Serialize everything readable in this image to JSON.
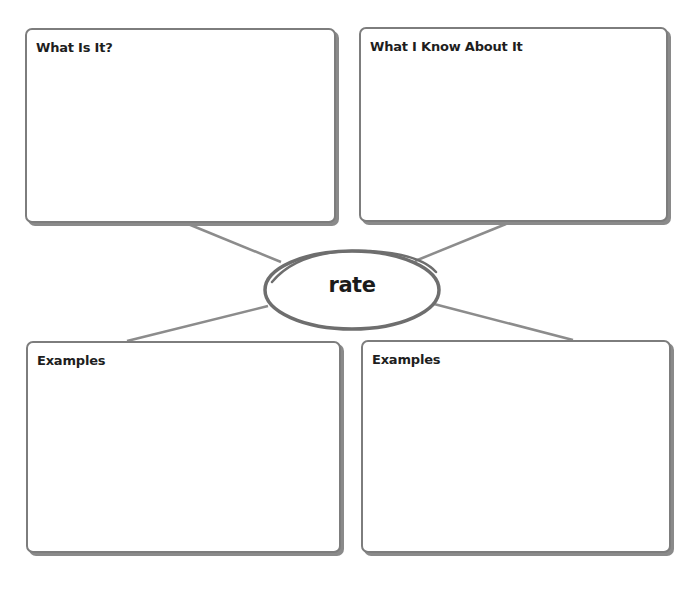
{
  "concept_map": {
    "center_word": "rate",
    "boxes": {
      "top_left": {
        "title": "What Is It?"
      },
      "top_right": {
        "title": "What I Know About It"
      },
      "bottom_left": {
        "title": "Examples"
      },
      "bottom_right": {
        "title": "Examples"
      }
    }
  },
  "colors": {
    "border": "#7d7d7d",
    "shadow": "#8a8a8a",
    "connector": "#8c8c8c",
    "ellipse": "#6e6e6e",
    "text": "#1e1e1e"
  }
}
